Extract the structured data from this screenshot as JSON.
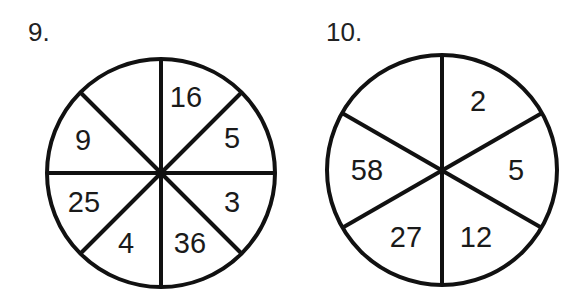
{
  "problems": [
    {
      "label": "9.",
      "sectors": 8,
      "values": {
        "top_left": "",
        "top_right": "16",
        "right_upper": "5",
        "right_lower": "3",
        "bottom_right": "36",
        "bottom_left": "4",
        "left_lower": "25",
        "left_upper": "9"
      }
    },
    {
      "label": "10.",
      "sectors": 6,
      "values": {
        "top_left": "",
        "top_right": "2",
        "right": "5",
        "bottom_right": "12",
        "bottom_left": "27",
        "left": "58"
      }
    }
  ],
  "colors": {
    "line": "#111111",
    "background": "#ffffff"
  }
}
